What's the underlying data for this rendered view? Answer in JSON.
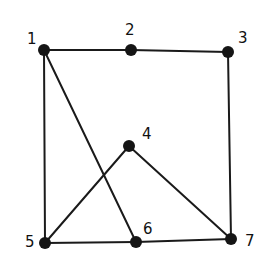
{
  "diagram": {
    "type": "undirected-graph",
    "nodes": [
      {
        "id": "1",
        "label": "1",
        "x": 44,
        "y": 50,
        "lx": 27,
        "ly": 44
      },
      {
        "id": "2",
        "label": "2",
        "x": 131,
        "y": 50,
        "lx": 125,
        "ly": 35
      },
      {
        "id": "3",
        "label": "3",
        "x": 228,
        "y": 52,
        "lx": 238,
        "ly": 43
      },
      {
        "id": "4",
        "label": "4",
        "x": 129,
        "y": 146,
        "lx": 142,
        "ly": 139
      },
      {
        "id": "5",
        "label": "5",
        "x": 45,
        "y": 243,
        "lx": 25,
        "ly": 247
      },
      {
        "id": "6",
        "label": "6",
        "x": 136,
        "y": 242,
        "lx": 143,
        "ly": 234
      },
      {
        "id": "7",
        "label": "7",
        "x": 231,
        "y": 239,
        "lx": 245,
        "ly": 246
      }
    ],
    "edges": [
      [
        "1",
        "2"
      ],
      [
        "2",
        "3"
      ],
      [
        "1",
        "5"
      ],
      [
        "1",
        "6"
      ],
      [
        "3",
        "7"
      ],
      [
        "4",
        "5"
      ],
      [
        "4",
        "7"
      ],
      [
        "5",
        "6"
      ],
      [
        "6",
        "7"
      ]
    ],
    "colors": {
      "edge": "#1a1a1a",
      "node": "#151515",
      "label": "#111111",
      "background": "#ffffff"
    }
  }
}
